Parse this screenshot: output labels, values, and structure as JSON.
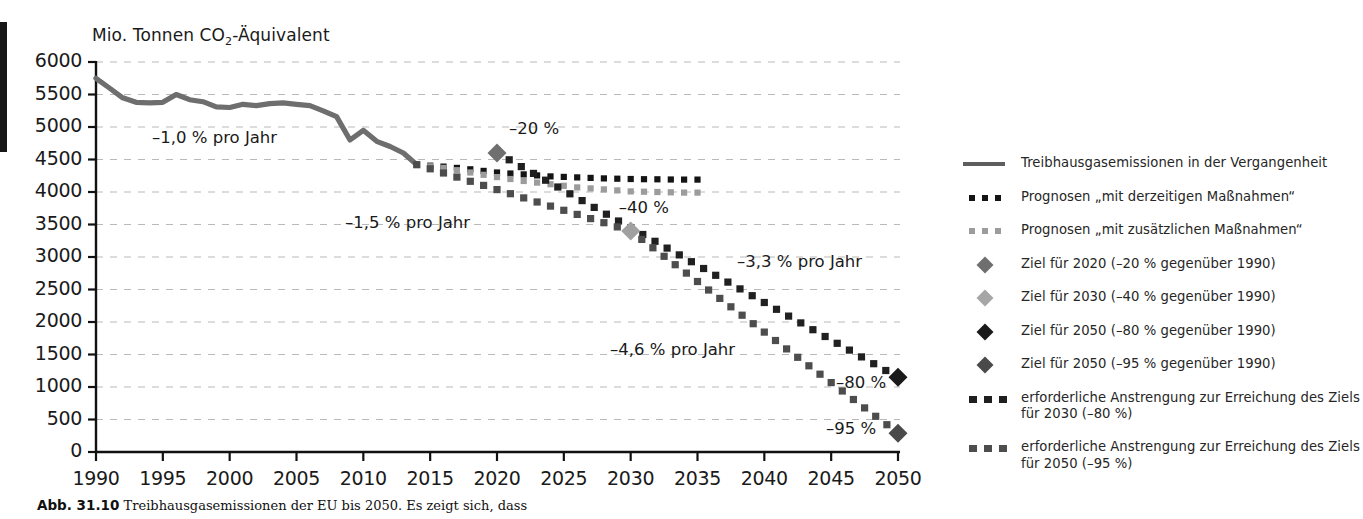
{
  "chart_data": {
    "type": "line",
    "title": "",
    "ylabel": "Mio. Tonnen CO2-Äquivalent",
    "ylabel_parts": {
      "pre": "Mio. Tonnen CO",
      "sub": "2",
      "post": "-Äquivalent"
    },
    "xlabel": "",
    "ylim": [
      0,
      6000
    ],
    "ytick_step": 500,
    "xlim": [
      1990,
      2050
    ],
    "xtick_step": 5,
    "grid": true,
    "yticks": [
      "6000",
      "5500",
      "5000",
      "4500",
      "4000",
      "3500",
      "3000",
      "2500",
      "2000",
      "1500",
      "1000",
      "500",
      "0"
    ],
    "xticks": [
      "1990",
      "1995",
      "2000",
      "2005",
      "2010",
      "2015",
      "2020",
      "2025",
      "2030",
      "2035",
      "2040",
      "2045",
      "2050"
    ],
    "series": [
      {
        "name": "Treibhausgasemissionen in der Vergangenheit",
        "style": "solid",
        "color": "#6e6e6e",
        "x": [
          1990,
          1991,
          1992,
          1993,
          1994,
          1995,
          1996,
          1997,
          1998,
          1999,
          2000,
          2001,
          2002,
          2003,
          2004,
          2005,
          2006,
          2007,
          2008,
          2009,
          2010,
          2011,
          2012,
          2013,
          2014
        ],
        "y": [
          5750,
          5600,
          5450,
          5380,
          5370,
          5380,
          5500,
          5420,
          5390,
          5310,
          5300,
          5350,
          5330,
          5360,
          5370,
          5350,
          5330,
          5250,
          5160,
          4800,
          4950,
          4780,
          4700,
          4600,
          4420
        ]
      },
      {
        "name": "Prognosen „mit derzeitigen Maßnahmen“",
        "style": "dotted",
        "color": "#141414",
        "x": [
          2014,
          2016,
          2018,
          2020,
          2022,
          2024,
          2026,
          2028,
          2030,
          2032,
          2034,
          2035
        ],
        "y": [
          4420,
          4390,
          4350,
          4300,
          4270,
          4240,
          4225,
          4210,
          4200,
          4195,
          4190,
          4190
        ]
      },
      {
        "name": "Prognosen „mit zusätzlichen Maßnahmen“",
        "style": "dotted",
        "color": "#9c9c9c",
        "x": [
          2014,
          2016,
          2018,
          2020,
          2022,
          2024,
          2026,
          2028,
          2030,
          2032,
          2034,
          2035
        ],
        "y": [
          4420,
          4370,
          4300,
          4230,
          4170,
          4120,
          4070,
          4040,
          4010,
          4000,
          3990,
          3990
        ]
      },
      {
        "name": "erforderliche Anstrengung zur Erreichung des Ziels für 2030 (-80 %)",
        "style": "dotted-bold",
        "color": "#202020",
        "x": [
          2020,
          2050
        ],
        "y": [
          4600,
          1150
        ]
      },
      {
        "name": "erforderliche Anstrengung zur Erreichung des Ziels für 2050 (-95 %)",
        "style": "dotted-bold",
        "color": "#4d4d4d",
        "x": [
          2014,
          2030,
          2050
        ],
        "y": [
          4420,
          3400,
          290
        ]
      }
    ],
    "markers": [
      {
        "name": "Ziel für 2020",
        "x": 2020,
        "y": 4600,
        "label": "–20 %",
        "color": "#6f6f6f"
      },
      {
        "name": "Ziel für 2030",
        "x": 2030,
        "y": 3400,
        "label": "–40 %",
        "color": "#a0a0a0"
      },
      {
        "name": "Ziel für 2050 (-80 %)",
        "x": 2050,
        "y": 1150,
        "label": "–80 %",
        "color": "#1a1a1a"
      },
      {
        "name": "Ziel für 2050 (-95 %)",
        "x": 2050,
        "y": 290,
        "label": "–95 %",
        "color": "#4a4a4a"
      }
    ],
    "annotations": [
      {
        "text": "–1,0 % pro Jahr",
        "x": 152,
        "y": 128
      },
      {
        "text": "–1,5 % pro Jahr",
        "x": 345,
        "y": 213
      },
      {
        "text": "–3,3 % pro Jahr",
        "x": 737,
        "y": 252
      },
      {
        "text": "–4,6 % pro Jahr",
        "x": 610,
        "y": 340
      }
    ]
  },
  "legend": {
    "items": [
      {
        "symbol": "solid-line",
        "color": "#5e5e5e",
        "label": "Treibhausgasemissionen in der Vergangenheit",
        "label2": ""
      },
      {
        "symbol": "dotted-line",
        "color": "#141414",
        "label": "Prognosen „mit derzeitigen Maßnahmen“",
        "label2": ""
      },
      {
        "symbol": "dotted-line",
        "color": "#9c9c9c",
        "label": "Prognosen „mit zusätzlichen Maßnahmen“",
        "label2": ""
      },
      {
        "symbol": "diamond",
        "color": "#6f6f6f",
        "label": "Ziel für 2020 (–20 % gegenüber 1990)",
        "label2": ""
      },
      {
        "symbol": "diamond",
        "color": "#a6a6a6",
        "label": "Ziel für 2030 (–40 % gegenüber 1990)",
        "label2": ""
      },
      {
        "symbol": "diamond",
        "color": "#1a1a1a",
        "label": "Ziel für 2050 (–80 % gegenüber 1990)",
        "label2": ""
      },
      {
        "symbol": "diamond",
        "color": "#4a4a4a",
        "label": "Ziel für 2050 (–95 % gegenüber 1990)",
        "label2": ""
      },
      {
        "symbol": "dotted-line-bold",
        "color": "#1f1f1f",
        "label": "erforderliche Anstrengung zur Erreichung des Ziels",
        "label2": "für 2030 (–80 %)"
      },
      {
        "symbol": "dotted-line-bold",
        "color": "#4d4d4d",
        "label": "erforderliche Anstrengung zur Erreichung des Ziels",
        "label2": "für 2050 (–95 %)"
      }
    ]
  },
  "caption": {
    "figure_number": "Abb. 31.10",
    "text": "Treibhausgasemissionen der EU bis 2050. Es zeigt sich, dass"
  }
}
